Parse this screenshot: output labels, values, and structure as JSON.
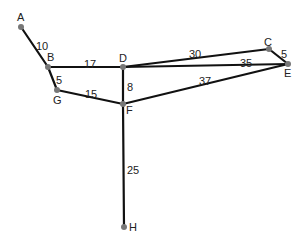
{
  "diagram": {
    "type": "weighted-graph",
    "nodes": [
      {
        "id": "A",
        "label": "A",
        "x": 21,
        "y": 27,
        "lx": 17,
        "ly": 21
      },
      {
        "id": "B",
        "label": "B",
        "x": 48,
        "y": 67,
        "lx": 47,
        "ly": 61
      },
      {
        "id": "C",
        "label": "C",
        "x": 269,
        "y": 49,
        "lx": 264,
        "ly": 46
      },
      {
        "id": "D",
        "label": "D",
        "x": 123,
        "y": 67,
        "lx": 119,
        "ly": 62
      },
      {
        "id": "E",
        "label": "E",
        "x": 288,
        "y": 64,
        "lx": 284,
        "ly": 77
      },
      {
        "id": "F",
        "label": "F",
        "x": 123,
        "y": 104,
        "lx": 126,
        "ly": 114
      },
      {
        "id": "G",
        "label": "G",
        "x": 57,
        "y": 90,
        "lx": 53,
        "ly": 104
      },
      {
        "id": "H",
        "label": "H",
        "x": 124,
        "y": 227,
        "lx": 129,
        "ly": 231
      }
    ],
    "edges": [
      {
        "from": "A",
        "to": "B",
        "weight": "10",
        "lx": 36,
        "ly": 46
      },
      {
        "from": "B",
        "to": "D",
        "weight": "17",
        "lx": 84,
        "ly": 64
      },
      {
        "from": "B",
        "to": "G",
        "weight": "5",
        "lx": 56,
        "ly": 80
      },
      {
        "from": "G",
        "to": "F",
        "weight": "15",
        "lx": 85,
        "ly": 94
      },
      {
        "from": "D",
        "to": "F",
        "weight": "8",
        "lx": 127,
        "ly": 87
      },
      {
        "from": "D",
        "to": "C",
        "weight": "30",
        "lx": 189,
        "ly": 54
      },
      {
        "from": "D",
        "to": "E",
        "weight": "35",
        "lx": 240,
        "ly": 63
      },
      {
        "from": "C",
        "to": "E",
        "weight": "5",
        "lx": 281,
        "ly": 54
      },
      {
        "from": "F",
        "to": "E",
        "weight": "37",
        "lx": 199,
        "ly": 81
      },
      {
        "from": "F",
        "to": "H",
        "weight": "25",
        "lx": 127,
        "ly": 170
      }
    ]
  }
}
